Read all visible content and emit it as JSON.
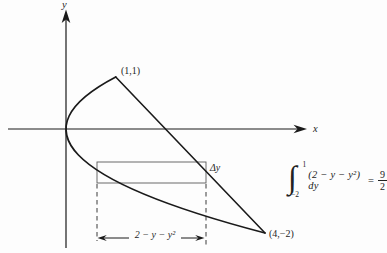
{
  "colors": {
    "ink": "#1a1a1a",
    "thin_line": "#5a5a5a",
    "dash_line": "#3a3a3a",
    "paper": "#fdfdfd"
  },
  "diagram": {
    "y_axis_label": "y",
    "x_axis_label": "x",
    "vertex_point_label": "(1,1)",
    "corner_point_label": "(4,−2)",
    "strip_thickness_label": "Δy",
    "strip_width_label": "2 − y − y²"
  },
  "equation": {
    "integral_sign": "∫",
    "upper_limit": "1",
    "lower_limit": "−2",
    "integrand": "(2 − y − y²) dy",
    "equals_sign": "=",
    "result_numerator": "9",
    "result_denominator": "2"
  }
}
